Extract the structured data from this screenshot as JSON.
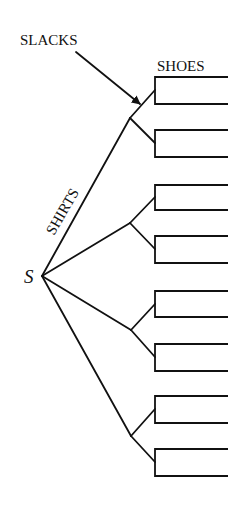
{
  "diagram": {
    "type": "tree",
    "title": "",
    "stroke_color": "#111111",
    "background": "#ffffff",
    "root": {
      "label": "S",
      "x": 42,
      "y": 276
    },
    "labels": {
      "slacks": "SLACKS",
      "shoes": "SHOES",
      "shirts": "SHIRTS",
      "root": "S"
    },
    "level_labels": [
      "SHIRTS",
      "SLACKS",
      "SHOES"
    ],
    "shirts_nodes": [
      {
        "x": 130,
        "y": 118
      },
      {
        "x": 130,
        "y": 223
      },
      {
        "x": 131,
        "y": 330
      },
      {
        "x": 131,
        "y": 436
      }
    ],
    "slacks_nodes": [
      {
        "parent": 0,
        "x": 155,
        "y": 90,
        "leaves": [
          77,
          104
        ]
      },
      {
        "parent": 0,
        "x": 155,
        "y": 143,
        "leaves": [
          130,
          157
        ]
      },
      {
        "parent": 1,
        "x": 155,
        "y": 197,
        "leaves": [
          185,
          210
        ]
      },
      {
        "parent": 1,
        "x": 155,
        "y": 249,
        "leaves": [
          236,
          263
        ]
      },
      {
        "parent": 2,
        "x": 155,
        "y": 304,
        "leaves": [
          291,
          317
        ]
      },
      {
        "parent": 2,
        "x": 155,
        "y": 357,
        "leaves": [
          344,
          371
        ]
      },
      {
        "parent": 3,
        "x": 155,
        "y": 409,
        "leaves": [
          396,
          423
        ]
      },
      {
        "parent": 3,
        "x": 155,
        "y": 462,
        "leaves": [
          449,
          476
        ]
      }
    ],
    "leaf_end_x": 228,
    "arrow": {
      "from": [
        76,
        52
      ],
      "to": [
        140,
        104
      ],
      "target": "slacks-branch"
    },
    "leaf_count": 16
  }
}
